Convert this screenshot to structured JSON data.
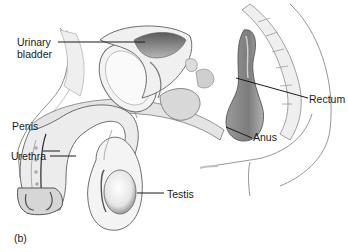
{
  "figure": {
    "panel_label": "(b)",
    "labels": {
      "urinary_bladder": "Urinary\nbladder",
      "urinary_bladder_line1": "Urinary",
      "urinary_bladder_line2": "bladder",
      "rectum": "Rectum",
      "penis": "Penis",
      "urethra": "Urethra",
      "anus": "Anus",
      "testis": "Testis"
    },
    "colors": {
      "ink": "#1a1a1a",
      "outline": "#6e6e6e",
      "light_fill": "#ededed",
      "mid_fill": "#c9c9c9",
      "dark_fill": "#8a8a8a",
      "background": "#ffffff"
    }
  }
}
